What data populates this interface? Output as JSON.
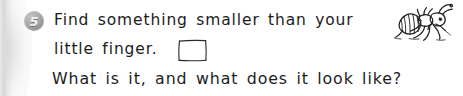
{
  "worksheet": {
    "question_number": "5",
    "lines": [
      "Find something smaller than your",
      "little finger.",
      "What is it, and what does it look like?"
    ],
    "line_2_prefix": "little finger.",
    "answer_box": {
      "label": "answer-box",
      "value": "",
      "placeholder": ""
    },
    "illustration": {
      "name": "ant-drawing",
      "description": "hand-drawn ant"
    },
    "colors": {
      "background": "#ffffff",
      "ink": "#1c1c1c",
      "badge_fill": "#a9a9a9",
      "badge_text": "#f2f2f2",
      "page_edge": "#d8d8d8"
    }
  }
}
